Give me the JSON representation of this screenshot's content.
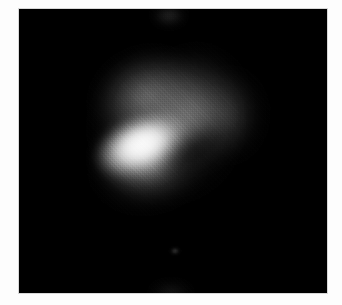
{
  "figure": {
    "domain": "Natural-Image",
    "kind": "grayscale-astronomical-plate",
    "description": "Monochrome astronomical exposure showing a bright, elongated, tilted elliptical core surrounded by fainter diffuse lobes on a black sky background.",
    "colormap": "grayscale",
    "visible_text": "",
    "canvas": {
      "width_px": 342,
      "height_px": 305,
      "background_color": "#ffffff"
    },
    "plate": {
      "name": "image-plate",
      "left_px": 19,
      "top_px": 9,
      "width_px": 308,
      "height_px": 284,
      "background_color": "#000000",
      "border_color": "#d8d8d8"
    },
    "matte": {
      "name": "white-matte",
      "color": "#fdfdfd"
    }
  },
  "features": [
    {
      "name": "core-bright",
      "label": "bright elliptical core",
      "center_x_px": 123,
      "center_y_px": 136,
      "semimajor_px": 51,
      "semiminor_px": 30,
      "position_angle_deg": -23,
      "peak_gray": 226,
      "peak_hex": "#e2e2e2"
    },
    {
      "name": "core-peak",
      "label": "core brightness peak",
      "center_x_px": 123,
      "center_y_px": 135,
      "peak_gray": 226,
      "peak_hex": "#e2e2e2"
    },
    {
      "name": "lobe-upper-left",
      "label": "north-west diffuse lobe",
      "center_x_px": 120,
      "center_y_px": 81,
      "position_angle_deg": -26,
      "peak_gray": 118,
      "peak_hex": "#767676"
    },
    {
      "name": "lobe-right",
      "label": "eastern diffuse lobe",
      "center_x_px": 185,
      "center_y_px": 105,
      "position_angle_deg": 8,
      "peak_gray": 104,
      "peak_hex": "#686868"
    },
    {
      "name": "lobe-right-tail",
      "label": "eastern faint extension",
      "center_x_px": 220,
      "center_y_px": 107,
      "peak_gray": 72,
      "peak_hex": "#484848"
    },
    {
      "name": "lobe-lower",
      "label": "southern diffuse lobe",
      "center_x_px": 132,
      "center_y_px": 164,
      "position_angle_deg": -14,
      "peak_gray": 112,
      "peak_hex": "#707070"
    },
    {
      "name": "dust-lane",
      "label": "dark lane south-east of core",
      "center_x_px": 176,
      "center_y_px": 142,
      "position_angle_deg": -36,
      "peak_gray": 14,
      "peak_hex": "#0e0e0e"
    },
    {
      "name": "field-star",
      "label": "faint field source",
      "center_x_px": 156,
      "center_y_px": 242,
      "peak_gray": 118,
      "peak_hex": "#767676"
    },
    {
      "name": "edge-flare-top",
      "label": "edge brightening, top centre",
      "center_x_px": 150,
      "center_y_px": 0,
      "peak_gray": 92,
      "peak_hex": "#5c5c5c"
    },
    {
      "name": "edge-flare-bottom",
      "label": "edge brightening, bottom centre",
      "center_x_px": 152,
      "center_y_px": 283,
      "peak_gray": 66,
      "peak_hex": "#424242"
    },
    {
      "name": "halo-outer",
      "label": "outer envelope",
      "center_x_px": 147,
      "center_y_px": 117,
      "position_angle_deg": -12,
      "peak_gray": 90,
      "peak_hex": "#5a5a5a"
    }
  ],
  "texture": {
    "name": "film-grain",
    "type": "ordered-dither",
    "cell_px": 2,
    "opacity": 0.3
  },
  "palette": {
    "sky_background": "#000000",
    "matte": "#fdfdfd",
    "plate_border": "#d8d8d8",
    "core_peak": "#e2e2e2",
    "core_mid": "#c6c6c6",
    "lobe_bright": "#767676",
    "lobe_faint": "#484848",
    "dark_lane": "#0e0e0e"
  }
}
